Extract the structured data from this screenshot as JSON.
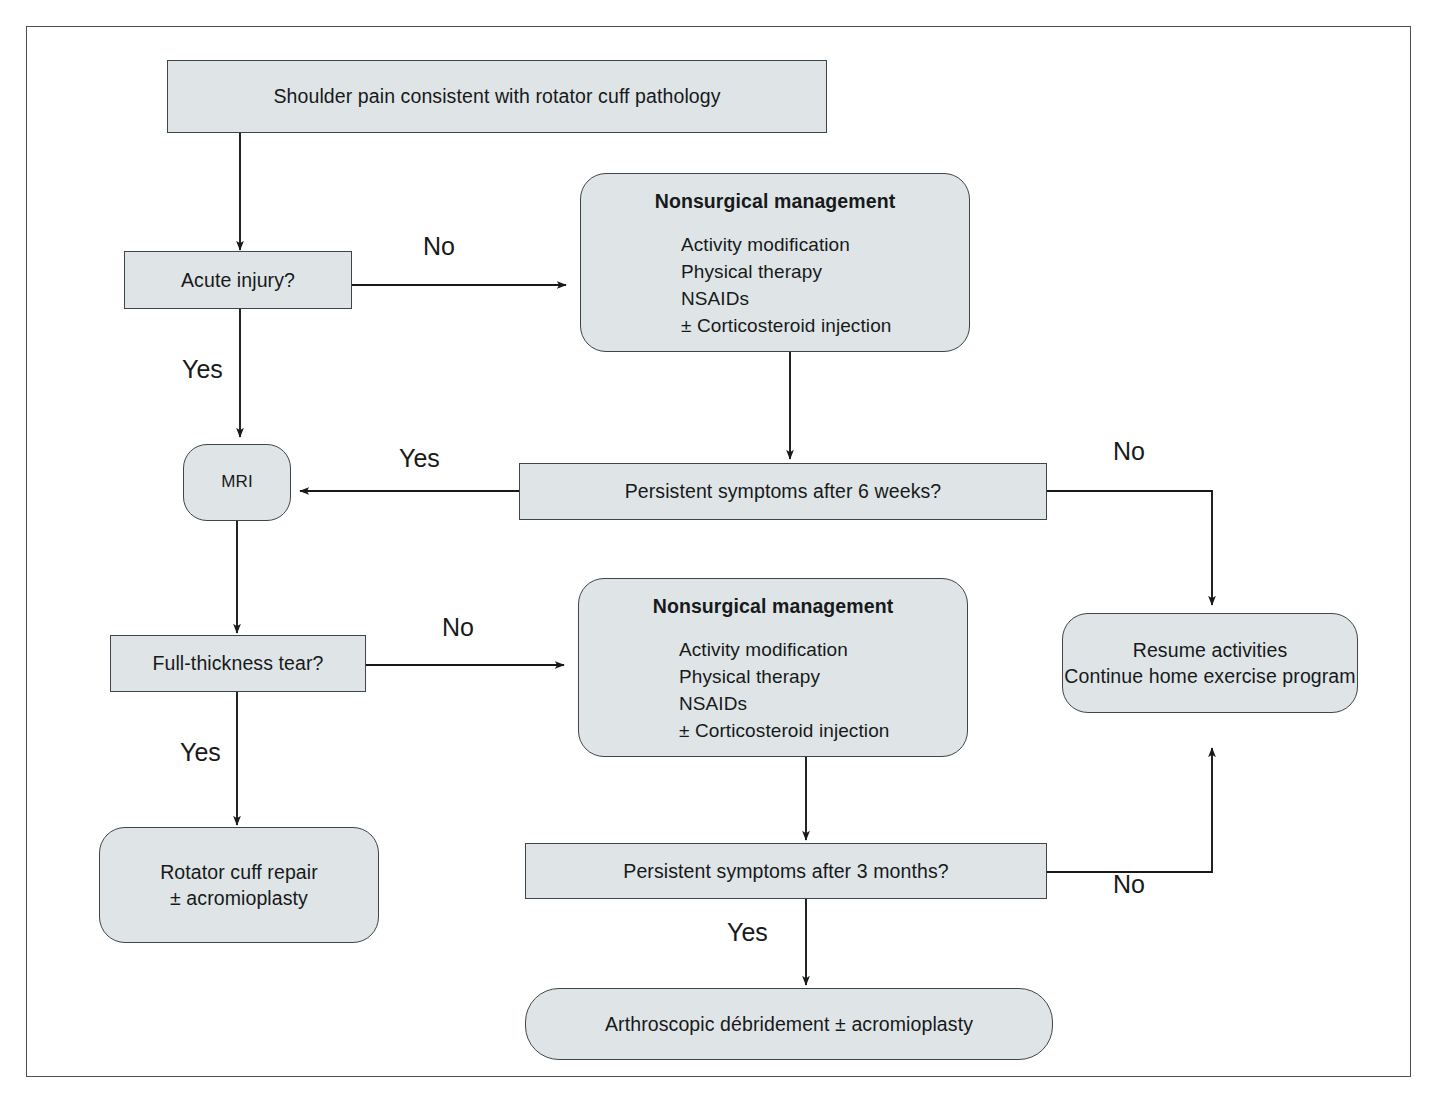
{
  "figure": {
    "type": "clinical-decision-flowchart",
    "border_color": "#4a4f52",
    "node_fill": "#dfe5e7",
    "node_border": "#3f4548",
    "background": "#ffffff"
  },
  "nodes": {
    "start": {
      "label": "Shoulder pain consistent with rotator cuff pathology",
      "shape": "rect"
    },
    "acute_injury": {
      "label": "Acute injury?",
      "shape": "rect"
    },
    "nonsurgical_top": {
      "title": "Nonsurgical management",
      "items": [
        "Activity modification",
        "Physical therapy",
        "NSAIDs",
        "± Corticosteroid injection"
      ],
      "shape": "round"
    },
    "mri": {
      "label": "MRI",
      "shape": "round"
    },
    "persistent_6_weeks": {
      "label": "Persistent symptoms after 6 weeks?",
      "shape": "rect"
    },
    "resume_activities": {
      "line1": "Resume activities",
      "line2": "Continue home exercise program",
      "shape": "round"
    },
    "full_thickness_tear": {
      "label": "Full-thickness tear?",
      "shape": "rect"
    },
    "nonsurgical_bottom": {
      "title": "Nonsurgical management",
      "items": [
        "Activity modification",
        "Physical therapy",
        "NSAIDs",
        "± Corticosteroid injection"
      ],
      "shape": "round"
    },
    "rotator_cuff_repair": {
      "line1": "Rotator cuff repair",
      "line2": "± acromioplasty",
      "shape": "round"
    },
    "persistent_3_months": {
      "label": "Persistent symptoms after 3 months?",
      "shape": "rect"
    },
    "arthroscopic_debridement": {
      "label": "Arthroscopic débridement ± acromioplasty",
      "shape": "pill"
    }
  },
  "edge_labels": {
    "acute_no": "No",
    "acute_yes": "Yes",
    "six_weeks_yes": "Yes",
    "six_weeks_no": "No",
    "tear_no": "No",
    "tear_yes": "Yes",
    "three_months_no": "No",
    "three_months_yes": "Yes"
  }
}
